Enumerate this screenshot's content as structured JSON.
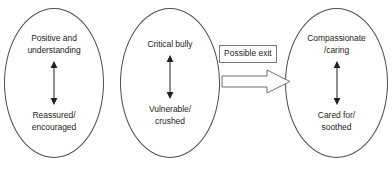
{
  "diagram": {
    "type": "flow-diagram",
    "background_color": "#ffffff",
    "outline_color": "#4d4d4d",
    "text_color": "#231f20",
    "nodes": [
      {
        "id": "positive",
        "top_label": "Positive and\nunderstanding",
        "bottom_label": "Reassured/\nencouraged",
        "connector": "double-headed-vertical-arrow"
      },
      {
        "id": "critical",
        "top_label": "Critical bully",
        "bottom_label": "Vulnerable/\ncrushed",
        "connector": "double-headed-vertical-arrow"
      },
      {
        "id": "compassionate",
        "top_label": "Compassionate\n/caring",
        "bottom_label": "Cared for/\nsoothed",
        "connector": "double-headed-vertical-arrow"
      }
    ],
    "transition": {
      "label": "Possible exit",
      "arrow_direction": "right"
    }
  }
}
